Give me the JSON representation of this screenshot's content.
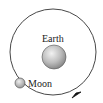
{
  "diagram": {
    "title": "",
    "labels": {
      "earth": "Earth",
      "moon": "Moon"
    },
    "orbit": {
      "cx": 53,
      "cy": 52,
      "r": 43,
      "direction": "counterclockwise",
      "stroke": "#333333"
    },
    "earth": {
      "cx": 54,
      "cy": 57,
      "r": 12,
      "fill_light": "#e8e8e8",
      "fill_dark": "#8a8a8a"
    },
    "moon": {
      "cx": 20,
      "cy": 83,
      "r": 5,
      "fill_light": "#e0e0e0",
      "fill_dark": "#8a8a8a"
    },
    "arrow": {
      "x": 77,
      "y": 95,
      "color": "#111111"
    }
  }
}
